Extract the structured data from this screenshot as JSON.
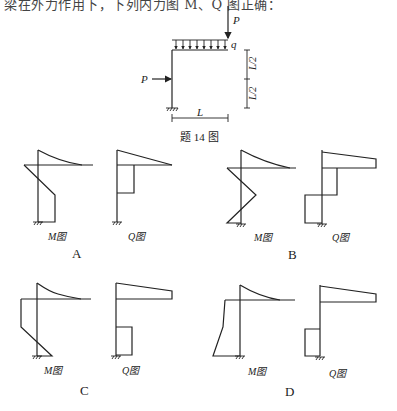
{
  "header": {
    "partial_text": "梁在外力作用下，下列内力图 M、Q 图正确："
  },
  "problem_figure": {
    "caption": "题 14 图",
    "loads": {
      "top_point_load": "P",
      "distributed_load": "q",
      "side_point_load": "P"
    },
    "dimensions": {
      "span": "L",
      "upper_half": "L/2",
      "lower_half": "L/2"
    }
  },
  "options": [
    {
      "letter": "A",
      "m_label": "M图",
      "q_label": "Q图"
    },
    {
      "letter": "B",
      "m_label": "M图",
      "q_label": "Q图"
    },
    {
      "letter": "C",
      "m_label": "M图",
      "q_label": "Q图"
    },
    {
      "letter": "D",
      "m_label": "M图",
      "q_label": "Q图"
    }
  ]
}
